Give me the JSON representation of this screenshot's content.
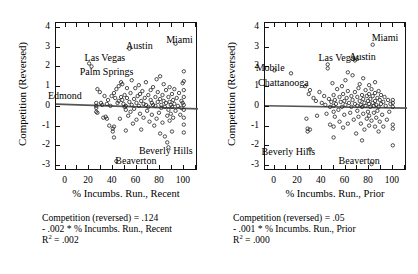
{
  "figure": {
    "background": "#ffffff",
    "ink": "#111111",
    "regression_line_color": "#555555"
  },
  "panels": [
    {
      "id": "recent",
      "ylabel": "Competition (Reversed)",
      "xlabel": "% Incumbs. Run., Recent",
      "yticks": [
        "4",
        "3",
        "2",
        "1",
        "0",
        "-1",
        "-2",
        "-3"
      ],
      "ytick_values": [
        4,
        3,
        2,
        1,
        0,
        -1,
        -2,
        -3
      ],
      "xticks": [
        "0",
        "20",
        "40",
        "60",
        "80",
        "100"
      ],
      "xtick_values": [
        0,
        20,
        40,
        60,
        80,
        100
      ],
      "annotations": [
        {
          "text": "Las Vegas",
          "x": 17,
          "y": 2.45,
          "anchor": "start"
        },
        {
          "text": "Austin",
          "x": 52,
          "y": 3.05,
          "anchor": "start"
        },
        {
          "text": "Miami",
          "x": 86,
          "y": 3.32,
          "anchor": "start"
        },
        {
          "text": "Palm Springs",
          "x": 13,
          "y": 1.7,
          "anchor": "start"
        },
        {
          "text": "Edmond",
          "x": -14,
          "y": 0.5,
          "anchor": "start"
        },
        {
          "text": "Beverly Hills",
          "x": 63,
          "y": -2.28,
          "anchor": "start"
        },
        {
          "text": "Beaverton",
          "x": 43,
          "y": -2.8,
          "anchor": "start"
        }
      ],
      "caption": {
        "line1": "Competition (reversed) = .124",
        "line2": "- .002 * % Incumbs. Run., Recent",
        "line3_prefix": "R",
        "line3_sup": "2",
        "line3_suffix": " = .002"
      },
      "fit": {
        "intercept": 0.124,
        "slope": -0.002,
        "r2": 0.002
      },
      "points": [
        [
          26,
          0.05
        ],
        [
          26,
          -0.05
        ],
        [
          26,
          0.2
        ],
        [
          26,
          -0.25
        ],
        [
          27,
          0.9
        ],
        [
          27,
          -0.3
        ],
        [
          29,
          0.75
        ],
        [
          30,
          0.2
        ],
        [
          31,
          0.1
        ],
        [
          32,
          -0.55
        ],
        [
          33,
          0.55
        ],
        [
          34,
          -0.5
        ],
        [
          35,
          0.15
        ],
        [
          35,
          -0.6
        ],
        [
          36,
          0.35
        ],
        [
          37,
          -0.95
        ],
        [
          38,
          0.05
        ],
        [
          39,
          0.55
        ],
        [
          40,
          -1.1
        ],
        [
          40,
          -1.25
        ],
        [
          41,
          0.7
        ],
        [
          41,
          -1.55
        ],
        [
          42,
          0.45
        ],
        [
          43,
          0.9
        ],
        [
          43,
          -2.75
        ],
        [
          44,
          0.2
        ],
        [
          45,
          0.3
        ],
        [
          45,
          1.05
        ],
        [
          46,
          -0.6
        ],
        [
          47,
          0.5
        ],
        [
          48,
          0.35
        ],
        [
          48,
          1.15
        ],
        [
          49,
          0.15
        ],
        [
          50,
          0.0
        ],
        [
          50,
          0.6
        ],
        [
          51,
          0.05
        ],
        [
          51,
          -0.15
        ],
        [
          51,
          -1.2
        ],
        [
          52,
          0.45
        ],
        [
          52,
          0.95
        ],
        [
          53,
          -0.45
        ],
        [
          54,
          0.25
        ],
        [
          55,
          0.7
        ],
        [
          55,
          -0.25
        ],
        [
          56,
          0.1
        ],
        [
          56,
          1.35
        ],
        [
          57,
          -0.85
        ],
        [
          58,
          0.4
        ],
        [
          58,
          -0.1
        ],
        [
          59,
          0.95
        ],
        [
          60,
          0.2
        ],
        [
          60,
          -0.65
        ],
        [
          61,
          0.55
        ],
        [
          62,
          0.05
        ],
        [
          62,
          1.1
        ],
        [
          63,
          -0.35
        ],
        [
          64,
          0.3
        ],
        [
          64,
          -1.15
        ],
        [
          65,
          0.8
        ],
        [
          66,
          0.15
        ],
        [
          66,
          -0.55
        ],
        [
          67,
          0.45
        ],
        [
          68,
          0.1
        ],
        [
          68,
          1.25
        ],
        [
          69,
          -0.2
        ],
        [
          70,
          0.6
        ],
        [
          70,
          0.0
        ],
        [
          71,
          -0.75
        ],
        [
          72,
          0.35
        ],
        [
          72,
          0.85
        ],
        [
          73,
          0.2
        ],
        [
          73,
          -0.4
        ],
        [
          74,
          1.0
        ],
        [
          74,
          0.1
        ],
        [
          75,
          -0.95
        ],
        [
          76,
          0.5
        ],
        [
          76,
          0.05
        ],
        [
          77,
          -0.6
        ],
        [
          78,
          0.75
        ],
        [
          78,
          0.25
        ],
        [
          79,
          -0.3
        ],
        [
          80,
          0.4
        ],
        [
          80,
          1.55
        ],
        [
          80,
          -1.35
        ],
        [
          81,
          0.1
        ],
        [
          81,
          -0.05
        ],
        [
          82,
          0.6
        ],
        [
          82,
          -0.8
        ],
        [
          83,
          0.3
        ],
        [
          83,
          1.15
        ],
        [
          84,
          0.0
        ],
        [
          84,
          -1.5
        ],
        [
          85,
          0.85
        ],
        [
          85,
          0.2
        ],
        [
          86,
          -0.45
        ],
        [
          86,
          -1.8
        ],
        [
          87,
          0.5
        ],
        [
          87,
          -0.15
        ],
        [
          87,
          -2.05
        ],
        [
          88,
          1.0
        ],
        [
          88,
          0.25
        ],
        [
          88,
          -0.7
        ],
        [
          89,
          0.1
        ],
        [
          89,
          -0.35
        ],
        [
          90,
          0.65
        ],
        [
          90,
          0.0
        ],
        [
          90,
          -1.25
        ],
        [
          91,
          0.35
        ],
        [
          91,
          -0.55
        ],
        [
          92,
          0.9
        ],
        [
          92,
          0.15
        ],
        [
          93,
          -0.2
        ],
        [
          94,
          0.45
        ],
        [
          95,
          0.05
        ],
        [
          96,
          0.7
        ],
        [
          97,
          -0.4
        ],
        [
          98,
          0.3
        ],
        [
          99,
          1.2
        ],
        [
          100,
          1.8
        ],
        [
          100,
          1.3
        ],
        [
          100,
          0.85
        ],
        [
          100,
          0.5
        ],
        [
          100,
          0.1
        ],
        [
          100,
          -0.15
        ],
        [
          100,
          -0.55
        ],
        [
          100,
          -0.9
        ],
        [
          100,
          -1.3
        ],
        [
          99,
          0.2
        ],
        [
          98,
          -0.05
        ],
        [
          20,
          2.2
        ],
        [
          22,
          2.05
        ],
        [
          54,
          2.95
        ],
        [
          93,
          3.2
        ],
        [
          41,
          -1.0
        ],
        [
          47,
          1.25
        ],
        [
          63,
          0.65
        ],
        [
          77,
          1.4
        ]
      ]
    },
    {
      "id": "prior",
      "ylabel": "Competition (Reversed)",
      "xlabel": "% Incumbs. Run., Prior",
      "yticks": [
        "4",
        "3",
        "2",
        "1",
        "0",
        "-1",
        "-2",
        "-3"
      ],
      "ytick_values": [
        4,
        3,
        2,
        1,
        0,
        -1,
        -2,
        -3
      ],
      "xticks": [
        "0",
        "20",
        "40",
        "60",
        "80",
        "100"
      ],
      "xtick_values": [
        0,
        20,
        40,
        60,
        80,
        100
      ],
      "annotations": [
        {
          "text": "Miami",
          "x": 83,
          "y": 3.45,
          "anchor": "start"
        },
        {
          "text": "Las Vegas",
          "x": 38,
          "y": 2.45,
          "anchor": "start"
        },
        {
          "text": "Austin",
          "x": 64,
          "y": 2.5,
          "anchor": "start"
        },
        {
          "text": "Mobile",
          "x": -15,
          "y": 1.9,
          "anchor": "start"
        },
        {
          "text": "Chattanooga",
          "x": -13,
          "y": 1.18,
          "anchor": "start"
        },
        {
          "text": "Beverly Hills",
          "x": -10,
          "y": -2.35,
          "anchor": "start"
        },
        {
          "text": "Beaverton",
          "x": 55,
          "y": -2.8,
          "anchor": "start"
        }
      ],
      "caption": {
        "line1": "Competition (reversed) = .05",
        "line2": "- .001 * % Incumbs. Run., Prior",
        "line3_prefix": "R",
        "line3_sup": "2",
        "line3_suffix": " = .000"
      },
      "fit": {
        "intercept": 0.05,
        "slope": -0.001,
        "r2": 0.0
      },
      "points": [
        [
          0,
          1.85
        ],
        [
          14,
          1.7
        ],
        [
          26,
          1.05
        ],
        [
          27,
          -0.6
        ],
        [
          28,
          -1.1
        ],
        [
          28,
          -1.25
        ],
        [
          29,
          0.65
        ],
        [
          30,
          0.85
        ],
        [
          30,
          -2.15
        ],
        [
          33,
          0.45
        ],
        [
          35,
          0.3
        ],
        [
          36,
          -0.45
        ],
        [
          38,
          0.75
        ],
        [
          40,
          0.2
        ],
        [
          42,
          0.55
        ],
        [
          43,
          0.1
        ],
        [
          44,
          -0.35
        ],
        [
          45,
          1.95
        ],
        [
          46,
          0.4
        ],
        [
          47,
          0.0
        ],
        [
          47,
          -0.9
        ],
        [
          48,
          0.25
        ],
        [
          49,
          1.2
        ],
        [
          50,
          0.6
        ],
        [
          50,
          0.05
        ],
        [
          50,
          -0.25
        ],
        [
          50,
          -1.0
        ],
        [
          50,
          -1.55
        ],
        [
          51,
          0.35
        ],
        [
          51,
          -0.5
        ],
        [
          52,
          0.15
        ],
        [
          53,
          0.9
        ],
        [
          54,
          -0.15
        ],
        [
          55,
          0.5
        ],
        [
          55,
          -0.75
        ],
        [
          56,
          0.25
        ],
        [
          57,
          1.05
        ],
        [
          57,
          0.0
        ],
        [
          58,
          0.65
        ],
        [
          58,
          -1.05
        ],
        [
          59,
          0.3
        ],
        [
          59,
          -0.4
        ],
        [
          60,
          1.35
        ],
        [
          60,
          0.1
        ],
        [
          61,
          0.45
        ],
        [
          62,
          -0.85
        ],
        [
          62,
          0.8
        ],
        [
          63,
          0.2
        ],
        [
          64,
          -0.3
        ],
        [
          65,
          0.55
        ],
        [
          65,
          0.0
        ],
        [
          66,
          1.6
        ],
        [
          66,
          0.35
        ],
        [
          67,
          -0.65
        ],
        [
          68,
          0.75
        ],
        [
          68,
          0.15
        ],
        [
          69,
          -1.35
        ],
        [
          70,
          0.5
        ],
        [
          70,
          0.05
        ],
        [
          70,
          -0.2
        ],
        [
          71,
          0.95
        ],
        [
          71,
          -0.5
        ],
        [
          72,
          0.3
        ],
        [
          72,
          1.15
        ],
        [
          73,
          0.1
        ],
        [
          73,
          -0.85
        ],
        [
          74,
          0.6
        ],
        [
          74,
          0.0
        ],
        [
          74,
          -1.7
        ],
        [
          75,
          0.4
        ],
        [
          75,
          1.45
        ],
        [
          75,
          -0.35
        ],
        [
          76,
          0.2
        ],
        [
          76,
          -1.15
        ],
        [
          77,
          0.85
        ],
        [
          77,
          0.05
        ],
        [
          78,
          -0.6
        ],
        [
          78,
          0.55
        ],
        [
          79,
          0.3
        ],
        [
          79,
          -0.25
        ],
        [
          80,
          1.1
        ],
        [
          80,
          0.65
        ],
        [
          80,
          0.15
        ],
        [
          80,
          -0.45
        ],
        [
          80,
          -0.95
        ],
        [
          81,
          0.4
        ],
        [
          81,
          0.0
        ],
        [
          82,
          0.9
        ],
        [
          82,
          -0.7
        ],
        [
          82,
          -2.9
        ],
        [
          83,
          0.55
        ],
        [
          83,
          0.2
        ],
        [
          83,
          3.15
        ],
        [
          84,
          0.05
        ],
        [
          84,
          -0.3
        ],
        [
          85,
          1.25
        ],
        [
          85,
          0.7
        ],
        [
          85,
          0.3
        ],
        [
          85,
          -1.0
        ],
        [
          86,
          0.1
        ],
        [
          86,
          -0.55
        ],
        [
          87,
          0.45
        ],
        [
          87,
          -0.2
        ],
        [
          88,
          0.8
        ],
        [
          88,
          0.0
        ],
        [
          88,
          -1.25
        ],
        [
          89,
          0.35
        ],
        [
          89,
          -0.75
        ],
        [
          90,
          0.6
        ],
        [
          90,
          0.15
        ],
        [
          91,
          -0.4
        ],
        [
          92,
          0.25
        ],
        [
          92,
          -1.0
        ],
        [
          93,
          0.5
        ],
        [
          94,
          0.05
        ],
        [
          95,
          -0.65
        ],
        [
          96,
          0.35
        ],
        [
          97,
          -0.25
        ],
        [
          98,
          0.15
        ],
        [
          100,
          0.35
        ],
        [
          100,
          0.2
        ],
        [
          100,
          0.0
        ],
        [
          100,
          -0.9
        ],
        [
          100,
          -1.1
        ],
        [
          100,
          -1.95
        ],
        [
          68,
          2.35
        ],
        [
          45,
          2.15
        ],
        [
          62,
          1.75
        ],
        [
          30,
          -1.15
        ]
      ]
    }
  ]
}
